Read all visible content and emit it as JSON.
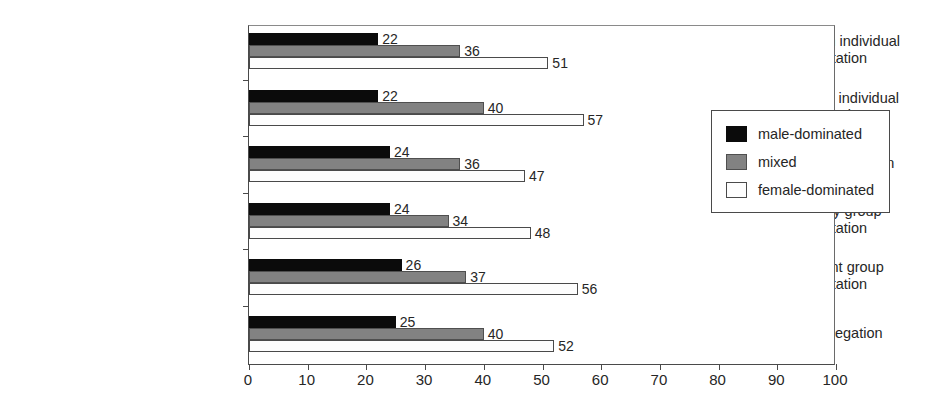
{
  "chart_data": {
    "type": "bar",
    "orientation": "horizontal",
    "title": "",
    "xlabel": "",
    "ylabel": "",
    "xlim": [
      0,
      100
    ],
    "xticks": [
      0,
      10,
      20,
      30,
      40,
      50,
      60,
      70,
      80,
      90,
      100
    ],
    "grid": false,
    "legend_position": "right-inside",
    "categories": [
      "arm's length individual\nconsultation",
      "face-to-face individual\nconsultation",
      "individual delegation",
      "temporary group\nconsultation",
      "permanent group\nconsultation",
      "group delegation"
    ],
    "series": [
      {
        "name": "male-dominated",
        "color": "#0b0b0b",
        "values": [
          22,
          22,
          24,
          24,
          26,
          25
        ]
      },
      {
        "name": "mixed",
        "color": "#828282",
        "values": [
          36,
          40,
          36,
          34,
          37,
          40
        ]
      },
      {
        "name": "female-dominated",
        "color": "#fdfdfd",
        "values": [
          51,
          57,
          47,
          48,
          56,
          52
        ]
      }
    ]
  }
}
